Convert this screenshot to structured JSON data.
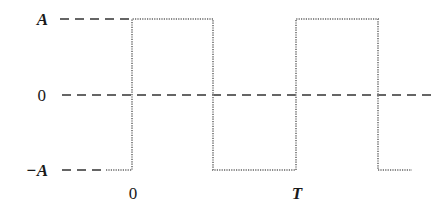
{
  "diagram": {
    "type": "square-wave",
    "levels": {
      "high_label": "A",
      "zero_label": "0",
      "low_label": "−A"
    },
    "time_labels": {
      "origin_label": "0",
      "period_label": "T"
    },
    "colors": {
      "reference_lines": "#333333",
      "waveform": "#8a8a8a",
      "text": "#1a1a1a"
    },
    "waveform_description": "Square wave switching between +A and −A; rises at t=0, falls at T/2, rises at T, falls at 3T/2"
  }
}
